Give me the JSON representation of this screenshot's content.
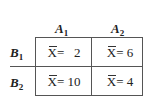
{
  "columns": [
    {
      "label": "A",
      "sub": "1"
    },
    {
      "label": "A",
      "sub": "2"
    }
  ],
  "rows": [
    {
      "label": "B",
      "sub": "1",
      "cells": [
        "2",
        "6"
      ]
    },
    {
      "label": "B",
      "sub": "2",
      "cells": [
        "10",
        "4"
      ]
    }
  ],
  "cell_symbol": "X",
  "cell_equals": [
    [
      "=   ",
      "= "
    ],
    [
      "= ",
      "= "
    ]
  ]
}
